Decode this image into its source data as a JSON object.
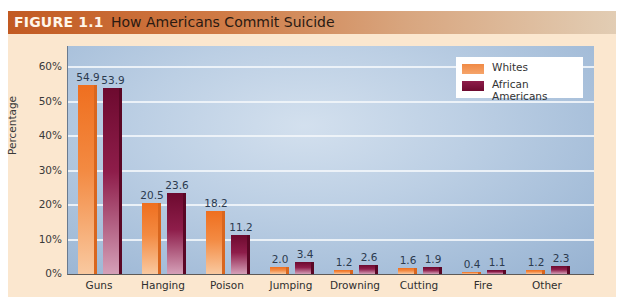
{
  "figure": {
    "label": "FIGURE 1.1",
    "title": "How Americans Commit Suicide"
  },
  "legend": {
    "whites": "Whites",
    "african_americans": "African Americans"
  },
  "colors": {
    "whites": "#ef6f1f",
    "african_americans": "#6d0a2f",
    "title_bar": "#c25a22",
    "panel": "#fbe7cf",
    "plot_bg": "#bccfe4"
  },
  "axis": {
    "ylabel": "Percentage",
    "yticks": [
      "0%",
      "10%",
      "20%",
      "30%",
      "40%",
      "50%",
      "60%"
    ]
  },
  "labels": {
    "w": [
      "54.9",
      "20.5",
      "18.2",
      "2.0",
      "1.2",
      "1.6",
      "0.4",
      "1.2"
    ],
    "a": [
      "53.9",
      "23.6",
      "11.2",
      "3.4",
      "2.6",
      "1.9",
      "1.1",
      "2.3"
    ]
  },
  "chart_data": {
    "type": "bar",
    "title": "How Americans Commit Suicide",
    "subtitle": "FIGURE 1.1",
    "xlabel": "",
    "ylabel": "Percentage",
    "ylim": [
      0,
      65
    ],
    "yticks": [
      0,
      10,
      20,
      30,
      40,
      50,
      60
    ],
    "grid": true,
    "legend_position": "top-right",
    "categories": [
      "Guns",
      "Hanging",
      "Poison",
      "Jumping",
      "Drowning",
      "Cutting",
      "Fire",
      "Other"
    ],
    "series": [
      {
        "name": "Whites",
        "values": [
          54.9,
          20.5,
          18.2,
          2.0,
          1.2,
          1.6,
          0.4,
          1.2
        ]
      },
      {
        "name": "African Americans",
        "values": [
          53.9,
          23.6,
          11.2,
          3.4,
          2.6,
          1.9,
          1.1,
          2.3
        ]
      }
    ]
  }
}
